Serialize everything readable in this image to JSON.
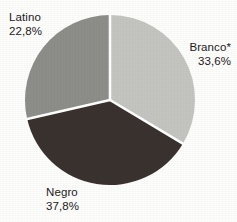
{
  "chart_data": {
    "type": "pie",
    "title": "",
    "subtitle": "",
    "xlabel": "",
    "ylabel": "",
    "legend_position": "none",
    "grid": false,
    "decimal_separator": ",",
    "value_unit": "%",
    "categories": [
      "Branco*",
      "Negro",
      "Latino"
    ],
    "values": [
      33.6,
      37.8,
      22.8
    ],
    "slices": [
      {
        "label": "Branco*",
        "value": 33.6,
        "value_text": "33,6%",
        "color": "#c4c4c0",
        "start_angle_deg": 0,
        "end_angle_deg": 120.96,
        "label_position": "right"
      },
      {
        "label": "Negro",
        "value": 37.8,
        "value_text": "37,8%",
        "color": "#3a322e",
        "start_angle_deg": 120.96,
        "end_angle_deg": 257.04,
        "label_position": "bottom-left"
      },
      {
        "label": "Latino",
        "value": 22.8,
        "value_text": "22,8%",
        "color": "#8d8d8a",
        "start_angle_deg": 257.04,
        "end_angle_deg": 360,
        "label_position": "top-left"
      }
    ],
    "geometry": {
      "center_x": 110,
      "center_y": 100,
      "radius": 85
    },
    "colors": {
      "background": "#fdfdfb",
      "separator": "#ffffff",
      "text": "#23201e"
    }
  }
}
